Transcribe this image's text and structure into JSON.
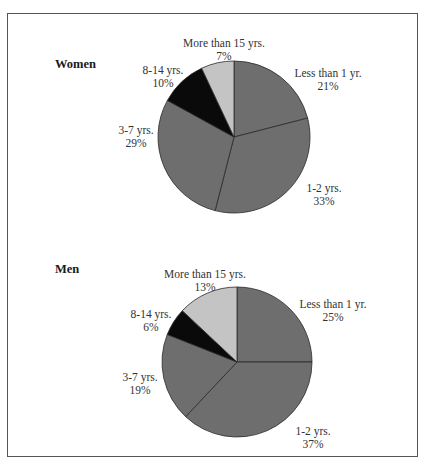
{
  "chart_data": [
    {
      "type": "pie",
      "title": "Women",
      "categories": [
        "Less than 1 yr.",
        "1-2 yrs.",
        "3-7 yrs.",
        "8-14 yrs.",
        "More than 15 yrs."
      ],
      "values": [
        21,
        33,
        29,
        10,
        7
      ],
      "labels": [
        "21%",
        "33%",
        "29%",
        "10%",
        "7%"
      ],
      "colors": [
        "#6e6e6e",
        "#6e6e6e",
        "#6e6e6e",
        "#0a0a0a",
        "#c4c4c4"
      ],
      "start_angle": "12 o'clock, clockwise"
    },
    {
      "type": "pie",
      "title": "Men",
      "categories": [
        "Less than 1 yr.",
        "1-2 yrs.",
        "3-7 yrs.",
        "8-14 yrs.",
        "More than 15 yrs."
      ],
      "values": [
        25,
        37,
        19,
        6,
        13
      ],
      "labels": [
        "25%",
        "37%",
        "19%",
        "6%",
        "13%"
      ],
      "colors": [
        "#6e6e6e",
        "#6e6e6e",
        "#6e6e6e",
        "#0a0a0a",
        "#c4c4c4"
      ],
      "start_angle": "12 o'clock, clockwise"
    }
  ],
  "women": {
    "title": "Women",
    "labels": [
      {
        "name": "Less than 1 yr.",
        "pct": "21%"
      },
      {
        "name": "1-2 yrs.",
        "pct": "33%"
      },
      {
        "name": "3-7 yrs.",
        "pct": "29%"
      },
      {
        "name": "8-14 yrs.",
        "pct": "10%"
      },
      {
        "name": "More than 15 yrs.",
        "pct": "7%"
      }
    ]
  },
  "men": {
    "title": "Men",
    "labels": [
      {
        "name": "Less than 1 yr.",
        "pct": "25%"
      },
      {
        "name": "1-2 yrs.",
        "pct": "37%"
      },
      {
        "name": "3-7 yrs.",
        "pct": "19%"
      },
      {
        "name": "8-14 yrs.",
        "pct": "6%"
      },
      {
        "name": "More than 15 yrs.",
        "pct": "13%"
      }
    ]
  }
}
